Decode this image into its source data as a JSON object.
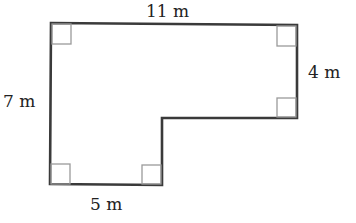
{
  "diagram": {
    "type": "composite-rectilinear-shape",
    "shape": "L-shape",
    "colors": {
      "outline": "#3a3a3a",
      "right_angle_marker": "#9a9a9a",
      "label": "#222222",
      "background": "#ffffff"
    },
    "labels": {
      "top": "11 m",
      "right": "4 m",
      "left": "7 m",
      "bottom": "5 m"
    },
    "dimensions": {
      "top_width_m": 11,
      "right_height_m": 4,
      "left_height_m": 7,
      "bottom_width_m": 5
    },
    "right_angle_markers": [
      "top-left",
      "top-right",
      "inner-right-step",
      "bottom-left",
      "bottom-inner"
    ]
  }
}
